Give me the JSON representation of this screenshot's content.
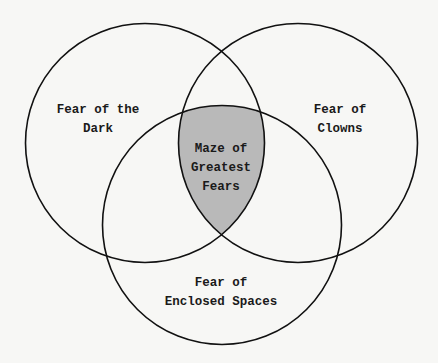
{
  "diagram": {
    "type": "venn-3",
    "colors": {
      "background": "#f7f7f5",
      "stroke": "#111111",
      "intersection_fill": "#b9b9b9"
    },
    "sets": [
      {
        "id": "dark",
        "line1": "Fear of the",
        "line2": "Dark"
      },
      {
        "id": "clowns",
        "line1": "Fear of",
        "line2": "Clowns"
      },
      {
        "id": "enclosed",
        "line1": "Fear of",
        "line2": "Enclosed Spaces"
      }
    ],
    "center": {
      "line1": "Maze of",
      "line2": "Greatest",
      "line3": "Fears"
    }
  }
}
